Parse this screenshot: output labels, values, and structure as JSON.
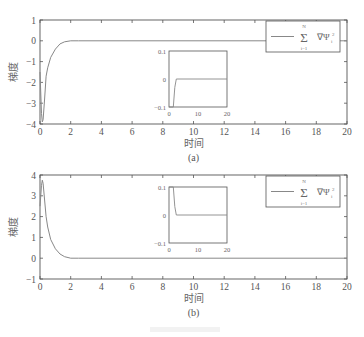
{
  "chart_data": [
    {
      "id": "a",
      "type": "line",
      "caption": "(a)",
      "xlabel": "时间",
      "ylabel": "梯度",
      "xlim": [
        0,
        20
      ],
      "ylim": [
        -4,
        1
      ],
      "xticks": [
        0,
        2,
        4,
        6,
        8,
        10,
        12,
        14,
        16,
        18,
        20
      ],
      "yticks": [
        1,
        0,
        -1,
        -2,
        -3,
        -4
      ],
      "ytick_labels": [
        "1",
        "0",
        "−1",
        "−2",
        "−3",
        "−4"
      ],
      "grid": false,
      "legend": {
        "position": "upper right",
        "entries": [
          "Σ_{i=1}^{N} ∇Ψ_i^2"
        ]
      },
      "series": [
        {
          "name": "Σ ∇Ψi²",
          "color": "#888888",
          "x": [
            0.0,
            0.1,
            0.15,
            0.2,
            0.3,
            0.4,
            0.5,
            0.7,
            1.0,
            1.3,
            1.6,
            2.0,
            2.5,
            20
          ],
          "y": [
            -1.5,
            -3.5,
            -3.9,
            -3.8,
            -2.8,
            -1.7,
            -1.3,
            -0.8,
            -0.4,
            -0.15,
            -0.05,
            0.0,
            0.0,
            0.0
          ]
        }
      ],
      "inset": {
        "xlim": [
          0,
          20
        ],
        "ylim": [
          -0.1,
          0.1
        ],
        "xticks": [
          0,
          10,
          20
        ],
        "yticks": [
          0.1,
          0,
          -0.1
        ],
        "ytick_labels": [
          "0.1",
          "0",
          "−0.1"
        ],
        "x": [
          0,
          1.5,
          2.0,
          2.5,
          20
        ],
        "y": [
          -0.1,
          -0.1,
          -0.03,
          0.0,
          0.0
        ]
      }
    },
    {
      "id": "b",
      "type": "line",
      "caption": "(b)",
      "xlabel": "时间",
      "ylabel": "梯度",
      "xlim": [
        0,
        20
      ],
      "ylim": [
        -1,
        4
      ],
      "xticks": [
        0,
        2,
        4,
        6,
        8,
        10,
        12,
        14,
        16,
        18,
        20
      ],
      "yticks": [
        4,
        3,
        2,
        1,
        0,
        -1
      ],
      "ytick_labels": [
        "4",
        "3",
        "2",
        "1",
        "0",
        "−1"
      ],
      "grid": false,
      "legend": {
        "position": "upper right",
        "entries": [
          "Σ_{i=1}^{N} ∇Ψ_i^2"
        ]
      },
      "series": [
        {
          "name": "Σ ∇Ψi²",
          "color": "#888888",
          "x": [
            0.0,
            0.1,
            0.15,
            0.2,
            0.3,
            0.4,
            0.5,
            0.7,
            1.0,
            1.3,
            1.6,
            2.0,
            2.5,
            20
          ],
          "y": [
            2.5,
            3.5,
            3.75,
            3.6,
            2.8,
            2.0,
            1.5,
            0.9,
            0.45,
            0.2,
            0.07,
            0.0,
            0.0,
            0.0
          ]
        }
      ],
      "inset": {
        "xlim": [
          0,
          20
        ],
        "ylim": [
          -0.1,
          0.1
        ],
        "xticks": [
          0,
          10,
          20
        ],
        "yticks": [
          0.1,
          0,
          -0.1
        ],
        "ytick_labels": [
          "0.1",
          "0",
          "−0.1"
        ],
        "x": [
          0,
          1.5,
          2.0,
          2.5,
          20
        ],
        "y": [
          0.1,
          0.1,
          0.03,
          0.0,
          0.0
        ]
      }
    }
  ],
  "labels": {
    "a": {
      "ylabel": "梯度",
      "xlabel": "时间",
      "caption": "(a)"
    },
    "b": {
      "ylabel": "梯度",
      "xlabel": "时间",
      "caption": "(b)"
    },
    "legend": {
      "sum": "Σ",
      "upper": "N",
      "lower": "i=1",
      "term": "∇Ψ",
      "sup": "2",
      "sub": "i"
    }
  },
  "colors": {
    "axis": "#555555",
    "line": "#888888",
    "text": "#555555"
  }
}
